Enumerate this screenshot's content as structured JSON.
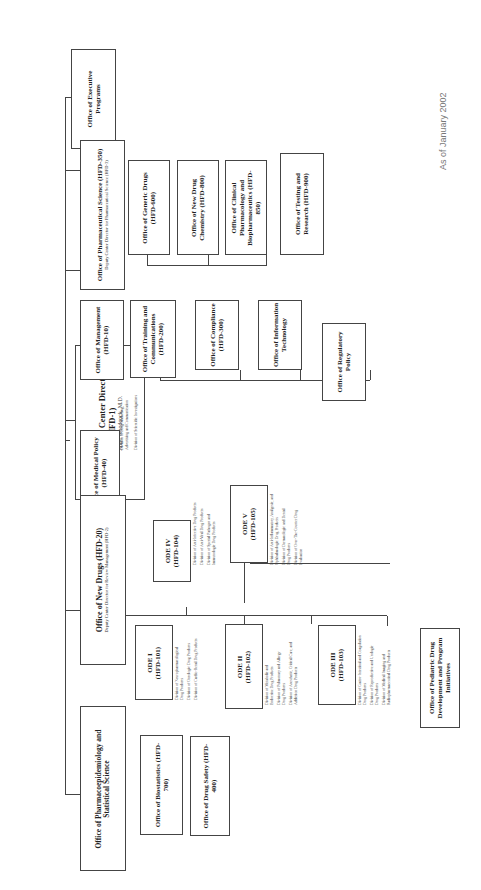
{
  "as_of": "As of January 2002",
  "director": {
    "title": "Office of the Center Director",
    "code": "(HFD-1)",
    "name": "Janet Woodcock, M.D."
  },
  "offices": {
    "executive": "Office of Executive Programs",
    "pharm_sci": {
      "title": "Office of Pharmaceutical Science (HFD-350)",
      "sub": "Deputy Center Director for Pharmaceutical Science (HFD-3)"
    },
    "generic": "Office of Generic Drugs (HFD-600)",
    "new_drug_chem": "Office of New Drug Chemistry (HFD-800)",
    "clin_pharm": "Office of Clinical Pharmacology and Biopharmaceutics (HFD-850)",
    "testing": "Office of Testing and Research (HFD-900)",
    "management": "Office of Management (HFD-10)",
    "training": "Office of Training and Communications (HFD-200)",
    "compliance": "Office of Compliance (HFD-300)",
    "info_tech": "Office of Information Technology",
    "reg_policy": "Office of Regulatory Policy",
    "medical_policy": {
      "title": "Office of Medical Policy (HFD-40)",
      "divisions": [
        "Division of Drug Marketing, Advertising and Communication",
        "Division of Scientific Investigations"
      ]
    },
    "new_drugs": {
      "title": "Office of New Drugs (HFD-20)",
      "sub": "Deputy Center Director for Review Management (HFD-2)"
    },
    "pharmacoepi": "Office of Pharmacoepidemiology and Statistical Science",
    "biostat": "Office of Biostatistics (HFD-700)",
    "drug_safety": "Office of Drug Safety (HFD-400)",
    "pediatric": "Office of Pediatric Drug Development and Program Initiatives"
  },
  "odes": {
    "ode1": {
      "title": "ODE I",
      "code": "(HFD-101)",
      "divisions": [
        "Division of Neuropharmacological Drug Products",
        "Division of Oncologic Drug Products",
        "Division of Cardio-Renal Drug Products"
      ]
    },
    "ode2": {
      "title": "ODE II",
      "code": "(HFD-102)",
      "divisions": [
        "Division of Metabolic and Endocrine Drug Products",
        "Division of Pulmonary and Allergy Drug Products",
        "Division of Anesthetic, Critical Care, and Addiction Drug Products"
      ]
    },
    "ode3": {
      "title": "ODE III",
      "code": "(HFD-103)",
      "divisions": [
        "Division of Gastro-Intestinal and Coagulation Drug Products",
        "Division of Reproductive and Urologic Drug Products",
        "Division of Medical Imaging and Radiopharmaceutical Drug Products"
      ]
    },
    "ode4": {
      "title": "ODE IV",
      "code": "(HFD-104)",
      "divisions": [
        "Division of Anti-Infective Drug Products",
        "Division of Anti-Viral Drug Products",
        "Division of Special Pathogen and Immunologic Drug Products"
      ]
    },
    "ode5": {
      "title": "ODE V",
      "code": "(HFD-105)",
      "divisions": [
        "Division of Anti-Inflammatory, Analgesic, and Ophthalmologic Drug Products",
        "Division of Dermatologic and Dental Drug Products",
        "Division of Over-The-Counter Drug Evaluation"
      ]
    }
  }
}
